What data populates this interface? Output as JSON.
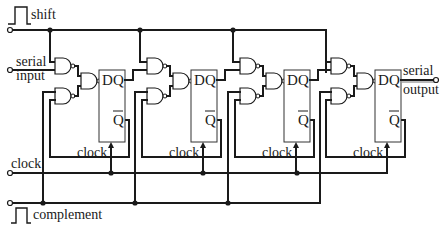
{
  "diagram": {
    "labels": {
      "shift": "shift",
      "serial_input_1": "serial",
      "serial_input_2": "input",
      "serial_output_1": "serial",
      "serial_output_2": "output",
      "clock": "clock",
      "complement": "complement"
    },
    "flipflops": [
      {
        "d": "D",
        "q": "Q",
        "qbar": "Q",
        "clock": "clock"
      },
      {
        "d": "D",
        "q": "Q",
        "qbar": "Q",
        "clock": "clock"
      },
      {
        "d": "D",
        "q": "Q",
        "qbar": "Q",
        "clock": "clock"
      },
      {
        "d": "D",
        "q": "Q",
        "qbar": "Q",
        "clock": "clock"
      }
    ],
    "colors": {
      "ink": "#1a1a1a",
      "background": "#ffffff"
    }
  }
}
